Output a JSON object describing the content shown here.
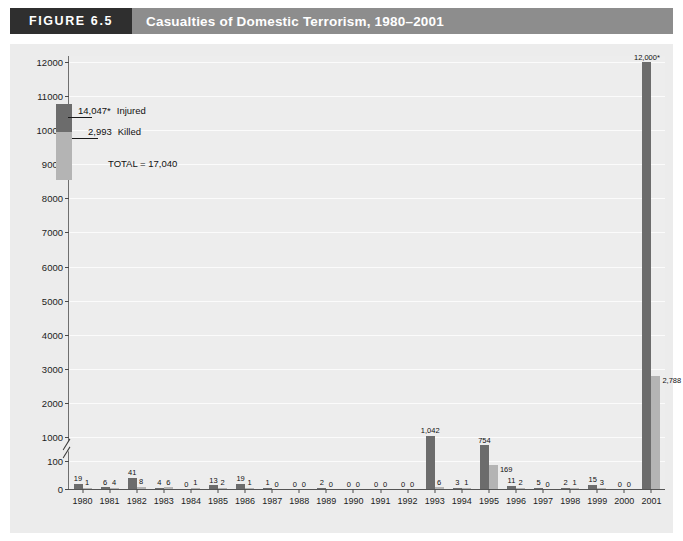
{
  "figure": {
    "number_label": "FIGURE 6.5",
    "title": "Casualties of Domestic Terrorism, 1980–2001"
  },
  "legend": {
    "injured_value": "14,047*",
    "injured_label": "Injured",
    "killed_value": "2,993",
    "killed_label": "Killed",
    "total_text": "TOTAL = 17,040"
  },
  "colors": {
    "injured": "#6c6c6c",
    "killed": "#b4b4b4",
    "header_band": "#8d8d8d",
    "figure_number_box": "#2f2f2f",
    "plot_background": "#ededed",
    "gridline": "#fbfbfb"
  },
  "chart_data": {
    "type": "bar",
    "title": "Casualties of Domestic Terrorism, 1980–2001",
    "xlabel": "",
    "ylabel": "",
    "grid": true,
    "legend_position": "upper-left-inset",
    "axis_break": {
      "between": [
        100,
        1000
      ],
      "note": "y-axis broken between 100 and 1000"
    },
    "ytick_labels": [
      "0",
      "100",
      "1000",
      "2000",
      "3000",
      "4000",
      "5000",
      "6000",
      "7000",
      "8000",
      "9000",
      "10000",
      "11000",
      "12000"
    ],
    "ylim": [
      0,
      12000
    ],
    "categories": [
      "1980",
      "1981",
      "1982",
      "1983",
      "1984",
      "1985",
      "1986",
      "1987",
      "1988",
      "1989",
      "1990",
      "1991",
      "1992",
      "1993",
      "1994",
      "1995",
      "1996",
      "1997",
      "1998",
      "1999",
      "2000",
      "2001"
    ],
    "series": [
      {
        "name": "Injured",
        "color": "#6c6c6c",
        "values": [
          19,
          6,
          41,
          4,
          0,
          13,
          19,
          1,
          0,
          2,
          0,
          0,
          0,
          1042,
          3,
          754,
          11,
          5,
          2,
          15,
          0,
          12000
        ],
        "labels": [
          "19",
          "6",
          "41",
          "4",
          "0",
          "13",
          "19",
          "1",
          "0",
          "2",
          "0",
          "0",
          "0",
          "1,042",
          "3",
          "754",
          "11",
          "5",
          "2",
          "15",
          "0",
          "12,000*"
        ]
      },
      {
        "name": "Killed",
        "color": "#b4b4b4",
        "values": [
          1,
          4,
          8,
          6,
          1,
          2,
          1,
          0,
          0,
          0,
          0,
          0,
          0,
          6,
          1,
          169,
          2,
          0,
          1,
          3,
          0,
          2788
        ],
        "labels": [
          "1",
          "4",
          "8",
          "6",
          "1",
          "2",
          "1",
          "0",
          "0",
          "0",
          "0",
          "0",
          "0",
          "6",
          "1",
          "169",
          "2",
          "0",
          "1",
          "3",
          "0",
          "2,788"
        ]
      }
    ],
    "totals": {
      "injured": 14047,
      "killed": 2993,
      "all": 17040
    }
  }
}
